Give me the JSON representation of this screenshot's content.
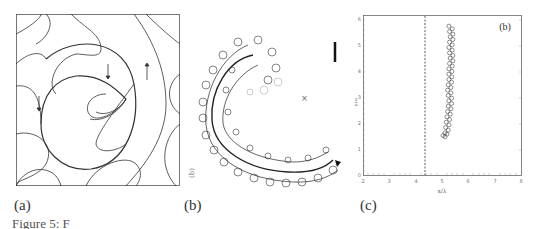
{
  "figure": {
    "panels": [
      {
        "id": "a",
        "label": "(a)",
        "description": "Streamline pattern of a spiral vortex with arrows in a square domain"
      },
      {
        "id": "b",
        "label": "(b)",
        "description": "Looping particle trajectory forming a spiral arc",
        "rotated_label": "(b)",
        "marker": "×"
      },
      {
        "id": "c",
        "label": "(c)",
        "inset_label": "(b)"
      }
    ],
    "caption_fragment": "Figure 5: F"
  },
  "chart_data": {
    "type": "scatter",
    "title": "",
    "inset_label": "(b)",
    "xlabel": "x/λ",
    "ylabel": "y/λ",
    "xticks": [
      "2",
      "3",
      "4",
      "5",
      "6",
      "7",
      "8"
    ],
    "yticks": [
      "0",
      "1",
      "2",
      "3",
      "4",
      "5",
      "6"
    ],
    "xlim": [
      2,
      8
    ],
    "ylim": [
      0,
      6
    ],
    "reference_line": {
      "type": "vertical",
      "style": "dashed",
      "x": 4.4
    },
    "series": [
      {
        "name": "trajectory",
        "x": [
          5.3,
          5.35,
          5.3,
          5.35,
          5.3,
          5.3,
          5.25,
          5.3,
          5.25,
          5.2,
          5.15,
          5.0
        ],
        "y": [
          5.6,
          5.2,
          4.8,
          4.4,
          4.0,
          3.6,
          3.2,
          2.8,
          2.4,
          2.0,
          1.6,
          1.4
        ]
      }
    ],
    "grid": false
  }
}
